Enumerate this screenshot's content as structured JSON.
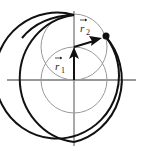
{
  "diagram": {
    "title": "",
    "labels": {
      "r1": {
        "letter": "r",
        "subscript": "1",
        "has_vector_arrow": true
      },
      "r2": {
        "letter": "r",
        "subscript": "2",
        "has_vector_arrow": true
      }
    },
    "elements": {
      "axes": {
        "horizontal": true,
        "vertical": true,
        "color": "#333333"
      },
      "outer_spiral_curve": {
        "color": "#111111",
        "description": "large thick arc around origin ending at dot"
      },
      "inner_circle_lower": {
        "color": "#999999"
      },
      "inner_circle_upper": {
        "color": "#999999"
      },
      "vector_r1": {
        "color": "#111111",
        "from": "origin",
        "direction": "up"
      },
      "vector_r2": {
        "color": "#111111",
        "from": "tip of r1",
        "direction": "up-right"
      },
      "endpoint_dot": {
        "color": "#111111"
      }
    }
  }
}
